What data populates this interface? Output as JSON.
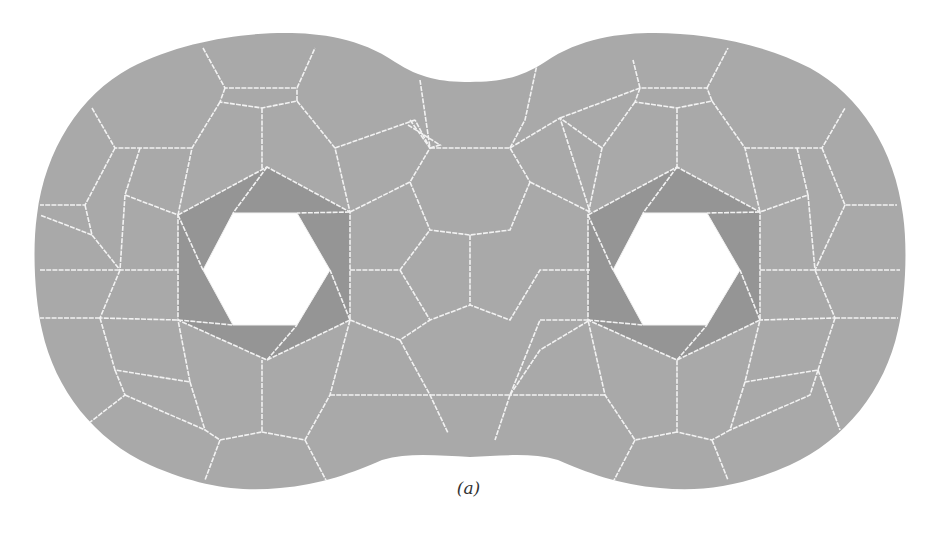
{
  "figure": {
    "caption": "(a)",
    "colors": {
      "surface": "#a9a9a9",
      "ring": "#959595",
      "edge": "#f2f2f2",
      "hole": "#ffffff",
      "background": "#ffffff"
    },
    "outline_path": "M 470 82 C 500 82, 520 78, 545 62 C 580 38, 620 33, 655 33 C 700 33, 760 42, 810 68 C 860 95, 895 150, 903 215 C 908 250, 905 300, 898 330 C 885 390, 845 440, 790 465 C 740 487, 700 492, 660 488 C 620 485, 585 472, 558 460 C 530 452, 500 456, 470 457 C 440 456, 410 452, 382 460 C 355 472, 320 485, 280 488 C 240 492, 200 487, 150 465 C 95 440, 55 390, 42 330 C 35 300, 32 250, 37 215 C 45 150, 80 95, 130 68 C 180 42, 240 33, 285 33 C 320 33, 360 38, 395 62 C 420 78, 440 82, 470 82 Z",
    "holes": [
      {
        "name": "left-hole",
        "hole_points": "203,270 233,213 297,213 330,270 297,325 233,325",
        "ring_points": "178,215 267,167 350,212 350,320 267,360 178,320"
      },
      {
        "name": "right-hole",
        "hole_points": "613,270 643,213 707,213 740,270 707,325 643,325",
        "ring_points": "588,215 677,167 760,212 760,320 677,360 588,320"
      }
    ],
    "edges": [
      "M 203 48 L 225 88 L 297 88 L 315 48",
      "M 225 88 L 220 102 L 262 108 L 297 101 L 297 88",
      "M 262 108 L 262 170",
      "M 297 101 L 335 148 L 350 212",
      "M 220 102 L 192 148 L 178 215",
      "M 92 108 L 115 148 L 192 148",
      "M 115 148 L 85 205 L 40 205",
      "M 140 148 L 125 195 L 178 215",
      "M 85 205 L 92 235 L 120 270 L 178 270",
      "M 125 195 L 120 270",
      "M 40 270 L 120 270",
      "M 92 235 L 40 215",
      "M 120 270 L 100 318 L 178 320",
      "M 100 318 L 115 370 L 190 382 L 178 320",
      "M 100 318 L 40 318",
      "M 115 370 L 125 395 L 80 430",
      "M 125 395 L 205 430",
      "M 190 382 L 205 430 L 220 440 L 262 432 L 262 360",
      "M 220 440 L 205 480",
      "M 262 432 L 305 440 L 330 395 L 350 320",
      "M 305 440 L 330 488",
      "M 330 395 L 430 395 L 448 433",
      "M 350 212 L 410 182 L 430 148 L 415 120",
      "M 335 148 L 415 120",
      "M 408 125 L 440 145 L 430 148",
      "M 410 182 L 430 230 L 470 235 L 510 230 L 530 182",
      "M 350 270 L 400 270 L 430 230",
      "M 400 270 L 430 320 L 470 305 L 510 320 L 540 270 L 590 270",
      "M 470 235 L 470 305",
      "M 350 320 L 400 340 L 430 320",
      "M 400 340 L 430 395",
      "M 430 148 L 510 148 L 530 182",
      "M 410 120 L 430 148",
      "M 510 148 L 525 120 L 538 60",
      "M 420 80 L 430 148",
      "M 430 395 L 510 395 L 540 320",
      "M 510 395 L 540 350 L 590 320",
      "M 510 395 L 495 440",
      "M 540 320 L 590 320",
      "M 530 182 L 590 212",
      "M 510 148 L 560 118 L 590 212",
      "M 560 118 L 640 88",
      "M 640 88 L 633 60",
      "M 640 88 L 635 102 L 677 108 L 712 101 L 707 88 L 640 88",
      "M 707 88 L 728 48",
      "M 677 108 L 677 170",
      "M 712 101 L 745 148 L 760 212",
      "M 635 102 L 602 148 L 588 215",
      "M 745 148 L 822 148 L 845 108",
      "M 822 148 L 845 205 L 897 205",
      "M 797 148 L 808 195 L 760 212",
      "M 808 195 L 815 270",
      "M 760 270 L 900 270",
      "M 845 205 L 815 270",
      "M 815 270 L 835 318 L 760 320",
      "M 835 318 L 898 318",
      "M 835 318 L 818 370 L 745 382 L 760 320",
      "M 818 370 L 840 430",
      "M 818 370 L 810 395 L 730 430",
      "M 745 382 L 730 430 L 712 440 L 677 432 L 677 360",
      "M 712 440 L 728 480",
      "M 677 432 L 635 440 L 605 395 L 588 320",
      "M 635 440 L 610 488",
      "M 605 395 L 510 395",
      "M 602 148 L 560 118"
    ]
  }
}
